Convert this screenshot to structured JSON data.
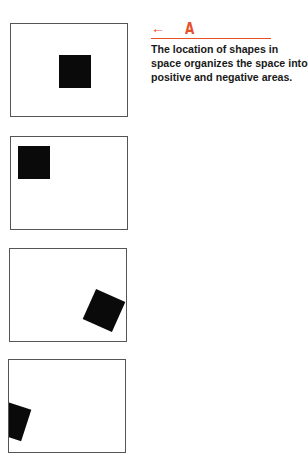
{
  "header": {
    "arrow_icon": "left-arrow-icon",
    "letter": "A",
    "accent_color": "#e8502a"
  },
  "caption": "The location of shapes in space organizes the space into positive and negative areas.",
  "figures": [
    {
      "label": "square-centered-right"
    },
    {
      "label": "square-top-left"
    },
    {
      "label": "tilted-square-bottom-right"
    },
    {
      "label": "tilted-square-clipped-left"
    }
  ]
}
